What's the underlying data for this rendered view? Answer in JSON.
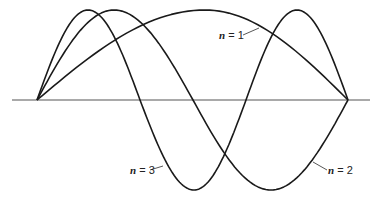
{
  "diagram": {
    "title": "",
    "axis": {
      "x1": 12,
      "x2": 370,
      "y": 100,
      "color": "#555555"
    },
    "stroke_color": "#1a1a1a",
    "curves": [
      {
        "id": "n1",
        "label_var": "n",
        "label_rest": " = 1",
        "humps": [
          {
            "x0": 37,
            "x1": 348,
            "peak_x": 205,
            "peak_y": 10
          }
        ]
      },
      {
        "id": "n2",
        "label_var": "n",
        "label_rest": " = 2",
        "humps": [
          {
            "x0": 37,
            "x1": 193,
            "peak_x": 114,
            "peak_y": 10
          },
          {
            "x0": 193,
            "x1": 348,
            "peak_x": 271,
            "peak_y": 190
          }
        ]
      },
      {
        "id": "n3",
        "label_var": "n",
        "label_rest": " = 3",
        "humps": [
          {
            "x0": 37,
            "x1": 140,
            "peak_x": 88,
            "peak_y": 10
          },
          {
            "x0": 140,
            "x1": 246,
            "peak_x": 194,
            "peak_y": 190
          },
          {
            "x0": 246,
            "x1": 348,
            "peak_x": 297,
            "peak_y": 10
          }
        ]
      }
    ],
    "labels": [
      {
        "curve": "n1",
        "x": 219,
        "y": 29,
        "leader": [
          243,
          35,
          259,
          28
        ]
      },
      {
        "curve": "n2",
        "x": 328,
        "y": 164,
        "leader": [
          313,
          162,
          327,
          170
        ]
      },
      {
        "curve": "n3",
        "x": 130,
        "y": 164,
        "leader": [
          150,
          170,
          163,
          166
        ]
      }
    ]
  }
}
